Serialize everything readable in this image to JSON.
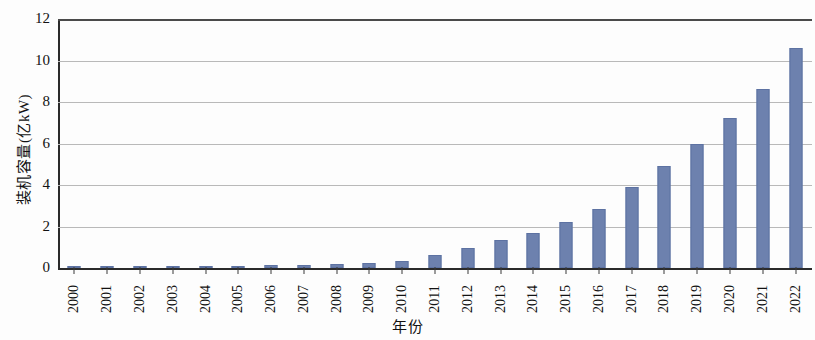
{
  "chart_data": {
    "type": "bar",
    "title": "",
    "xlabel": "年份",
    "ylabel": "装机容量(亿kW)",
    "ylim": [
      0,
      12
    ],
    "yticks": [
      0,
      2,
      4,
      6,
      8,
      10,
      12
    ],
    "grid": true,
    "legend": false,
    "bar_color": "#6d81ae",
    "categories": [
      "2000",
      "2001",
      "2002",
      "2003",
      "2004",
      "2005",
      "2006",
      "2007",
      "2008",
      "2009",
      "2010",
      "2011",
      "2012",
      "2013",
      "2014",
      "2015",
      "2016",
      "2017",
      "2018",
      "2019",
      "2020",
      "2021",
      "2022"
    ],
    "values": [
      0.03,
      0.04,
      0.05,
      0.06,
      0.08,
      0.1,
      0.13,
      0.16,
      0.18,
      0.22,
      0.34,
      0.62,
      0.95,
      1.35,
      1.7,
      2.2,
      2.85,
      3.9,
      4.9,
      6.0,
      7.25,
      8.65,
      10.6
    ]
  }
}
